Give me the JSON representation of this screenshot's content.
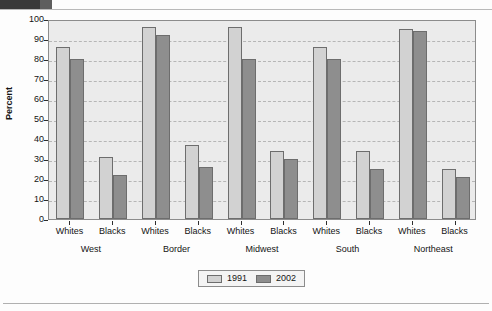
{
  "chart_data": {
    "type": "bar",
    "title": "",
    "xlabel": "",
    "ylabel": "Percent",
    "ylim": [
      0,
      100
    ],
    "ytick_step": 10,
    "yticks": [
      100,
      90,
      80,
      70,
      60,
      50,
      40,
      30,
      20,
      10,
      0
    ],
    "grid": true,
    "legend_position": "bottom-center",
    "groups": [
      "West",
      "Border",
      "Midwest",
      "South",
      "Northeast"
    ],
    "subcategories": [
      "Whites",
      "Blacks"
    ],
    "categories": [
      "West Whites",
      "West Blacks",
      "Border Whites",
      "Border Blacks",
      "Midwest Whites",
      "Midwest Blacks",
      "South Whites",
      "South Blacks",
      "Northeast Whites",
      "Northeast Blacks"
    ],
    "series": [
      {
        "name": "1991",
        "color": "#d2d2d2",
        "values": [
          86,
          31,
          96,
          37,
          96,
          34,
          86,
          34,
          95,
          25
        ]
      },
      {
        "name": "2002",
        "color": "#8e8e8e",
        "values": [
          80,
          22,
          92,
          26,
          80,
          30,
          80,
          25,
          94,
          21
        ]
      }
    ]
  },
  "legend": {
    "items": [
      {
        "label": "1991",
        "swatch": "legend-swatch-1991"
      },
      {
        "label": "2002",
        "swatch": "legend-swatch-2002"
      }
    ]
  },
  "axes": {
    "y_title": "Percent"
  }
}
